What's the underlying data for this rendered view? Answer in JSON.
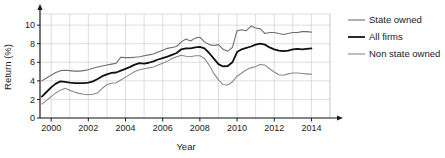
{
  "chart_data": {
    "type": "line",
    "title": "",
    "xlabel": "Year",
    "ylabel": "Return (%)",
    "xlim": [
      1999.4,
      2015.0
    ],
    "ylim": [
      0,
      11.2
    ],
    "xticks": [
      "2000",
      "2002",
      "2004",
      "2006",
      "2008",
      "2010",
      "2012",
      "2014"
    ],
    "xtick_values": [
      2000,
      2002,
      2004,
      2006,
      2008,
      2010,
      2012,
      2014
    ],
    "yticks": [
      "0",
      "2",
      "4",
      "6",
      "8",
      "10"
    ],
    "ytick_values": [
      0,
      2,
      4,
      6,
      8,
      10
    ],
    "grid": true,
    "grid_color": "#c8c8c8",
    "legend_position": "right",
    "x": [
      1999.5,
      1999.75,
      2000.0,
      2000.25,
      2000.5,
      2000.75,
      2001.0,
      2001.25,
      2001.5,
      2001.75,
      2002.0,
      2002.25,
      2002.5,
      2002.75,
      2003.0,
      2003.25,
      2003.5,
      2003.75,
      2004.0,
      2004.25,
      2004.5,
      2004.75,
      2005.0,
      2005.25,
      2005.5,
      2005.75,
      2006.0,
      2006.25,
      2006.5,
      2006.75,
      2007.0,
      2007.25,
      2007.5,
      2007.75,
      2008.0,
      2008.25,
      2008.5,
      2008.75,
      2009.0,
      2009.25,
      2009.5,
      2009.75,
      2010.0,
      2010.25,
      2010.5,
      2010.75,
      2011.0,
      2011.25,
      2011.5,
      2011.75,
      2012.0,
      2012.25,
      2012.5,
      2012.75,
      2013.0,
      2013.25,
      2013.5,
      2013.75,
      2014.0
    ],
    "series": [
      {
        "name": "State owned",
        "color": "#6e6e6e",
        "width": 1.1,
        "values": [
          4.0,
          4.3,
          4.6,
          4.9,
          5.1,
          5.15,
          5.1,
          5.05,
          5.05,
          5.1,
          5.2,
          5.35,
          5.5,
          5.6,
          5.7,
          5.8,
          5.9,
          6.55,
          6.5,
          6.5,
          6.55,
          6.6,
          6.7,
          6.8,
          6.9,
          7.1,
          7.3,
          7.5,
          7.6,
          7.7,
          8.2,
          8.5,
          8.3,
          8.6,
          8.7,
          8.2,
          7.9,
          7.8,
          7.9,
          7.4,
          7.2,
          7.6,
          9.4,
          9.5,
          9.4,
          9.9,
          9.7,
          9.6,
          9.1,
          9.2,
          9.2,
          9.1,
          9.0,
          9.1,
          9.2,
          9.2,
          9.3,
          9.3,
          9.25
        ]
      },
      {
        "name": "All firms",
        "color": "#111111",
        "width": 1.8,
        "values": [
          2.3,
          2.8,
          3.3,
          3.7,
          3.95,
          3.9,
          3.8,
          3.75,
          3.75,
          3.75,
          3.8,
          3.95,
          4.2,
          4.5,
          4.7,
          4.85,
          4.9,
          5.1,
          5.3,
          5.5,
          5.75,
          5.9,
          5.85,
          5.95,
          6.1,
          6.3,
          6.45,
          6.6,
          6.8,
          7.0,
          7.4,
          7.5,
          7.5,
          7.6,
          7.65,
          7.5,
          7.0,
          6.4,
          5.8,
          5.55,
          5.6,
          6.0,
          7.1,
          7.4,
          7.55,
          7.7,
          7.9,
          8.0,
          7.9,
          7.6,
          7.4,
          7.25,
          7.2,
          7.25,
          7.4,
          7.45,
          7.4,
          7.45,
          7.5
        ]
      },
      {
        "name": "Non state owned",
        "color": "#8a8a8a",
        "width": 1.1,
        "values": [
          1.5,
          1.9,
          2.3,
          2.7,
          3.0,
          3.2,
          3.0,
          2.8,
          2.65,
          2.55,
          2.5,
          2.55,
          2.7,
          3.2,
          3.6,
          3.75,
          3.8,
          4.1,
          4.4,
          4.7,
          5.0,
          5.2,
          5.3,
          5.4,
          5.5,
          5.7,
          5.9,
          6.1,
          6.4,
          6.6,
          6.75,
          6.65,
          6.6,
          6.7,
          6.7,
          6.4,
          5.7,
          4.8,
          4.1,
          3.6,
          3.55,
          3.9,
          4.5,
          4.85,
          5.2,
          5.4,
          5.55,
          5.75,
          5.7,
          5.3,
          4.95,
          4.65,
          4.6,
          4.75,
          4.85,
          4.85,
          4.8,
          4.75,
          4.7
        ]
      }
    ]
  },
  "legend": {
    "items": [
      {
        "label": "State owned",
        "color": "#6e6e6e",
        "width": 1.1
      },
      {
        "label": "All firms",
        "color": "#111111",
        "width": 1.8
      },
      {
        "label": "Non state owned",
        "color": "#8a8a8a",
        "width": 1.1
      }
    ]
  },
  "axes": {
    "x_title": "Year",
    "y_title": "Return (%)"
  },
  "colors": {
    "axis": "#1a1a1a",
    "grid": "#c8c8c8",
    "background": "#ffffff"
  }
}
